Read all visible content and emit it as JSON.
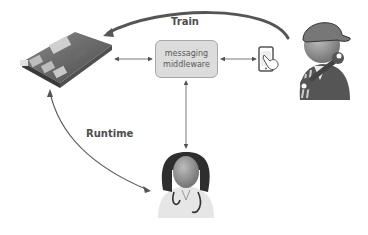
{
  "diagram": {
    "middleware": {
      "line1": "messaging",
      "line2": "middleware"
    },
    "edges": {
      "train": "Train",
      "runtime": "Runtime"
    },
    "nodes": [
      "embedded-board",
      "messaging-middleware",
      "mobile-phone",
      "technician",
      "doctor"
    ],
    "colors": {
      "box_fill": "#dcdcdc",
      "box_border": "#a8a8a8",
      "arrow": "#555555",
      "text": "#4d4d4d"
    }
  }
}
